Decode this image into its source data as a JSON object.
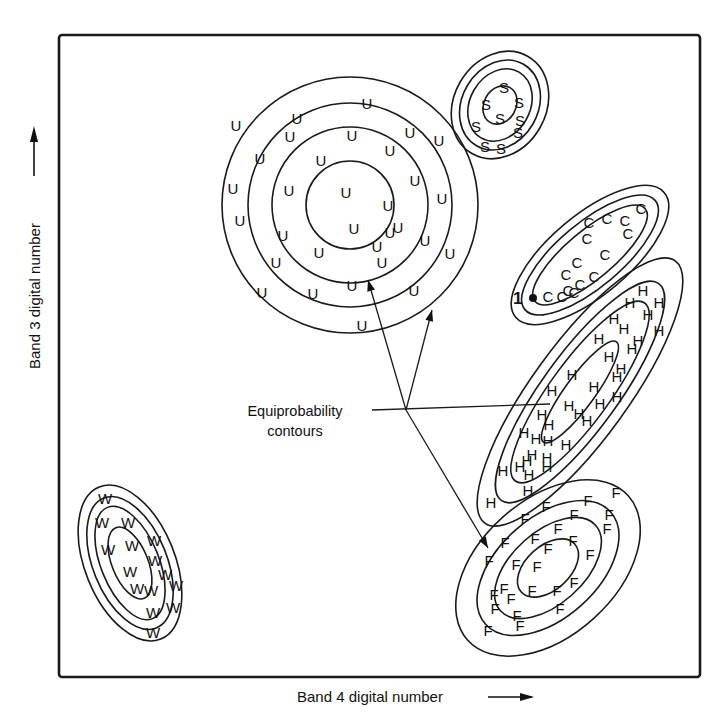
{
  "figure": {
    "x_axis_label": "Band 4 digital number",
    "y_axis_label": "Band 3 digital number",
    "annotation": {
      "line1": "Equiprobability",
      "line2": "contours",
      "anchor": [
        406,
        410
      ],
      "arrow_targets": [
        [
          368,
          280
        ],
        [
          432,
          310
        ],
        [
          488,
          548
        ]
      ],
      "line_target": [
        550,
        404
      ]
    },
    "unknown_pixel": {
      "label": "1",
      "position": [
        533,
        298
      ]
    },
    "frame": {
      "x": 59,
      "y": 35,
      "width": 641,
      "height": 642
    }
  },
  "clusters": [
    {
      "class": "U",
      "name": "Urban",
      "center": [
        350,
        205
      ],
      "rotation": 0,
      "contours": [
        [
          128,
          128
        ],
        [
          102,
          102
        ],
        [
          78,
          78
        ],
        [
          44,
          44
        ]
      ],
      "points": [
        [
          297,
          118
        ],
        [
          367,
          103
        ],
        [
          236,
          125
        ],
        [
          290,
          136
        ],
        [
          352,
          135
        ],
        [
          410,
          132
        ],
        [
          439,
          140
        ],
        [
          260,
          158
        ],
        [
          321,
          160
        ],
        [
          390,
          150
        ],
        [
          415,
          180
        ],
        [
          233,
          188
        ],
        [
          289,
          190
        ],
        [
          346,
          192
        ],
        [
          388,
          205
        ],
        [
          442,
          198
        ],
        [
          240,
          220
        ],
        [
          283,
          235
        ],
        [
          354,
          228
        ],
        [
          390,
          232
        ],
        [
          425,
          240
        ],
        [
          276,
          262
        ],
        [
          319,
          252
        ],
        [
          382,
          262
        ],
        [
          450,
          253
        ],
        [
          262,
          292
        ],
        [
          313,
          293
        ],
        [
          352,
          285
        ],
        [
          414,
          290
        ],
        [
          362,
          325
        ],
        [
          377,
          246
        ],
        [
          398,
          227
        ]
      ]
    },
    {
      "class": "S",
      "name": "Sand",
      "center": [
        500,
        105
      ],
      "rotation": -60,
      "contours": [
        [
          56,
          46
        ],
        [
          47,
          38
        ],
        [
          38,
          30
        ],
        [
          20,
          16
        ]
      ],
      "points": [
        [
          504,
          87
        ],
        [
          486,
          104
        ],
        [
          519,
          102
        ],
        [
          500,
          118
        ],
        [
          520,
          120
        ],
        [
          476,
          126
        ],
        [
          518,
          132
        ],
        [
          485,
          146
        ],
        [
          501,
          148
        ]
      ]
    },
    {
      "class": "C",
      "name": "Corn",
      "center": [
        590,
        255
      ],
      "rotation": -40,
      "contours": [
        [
          97,
          40
        ],
        [
          85,
          32
        ],
        [
          72,
          24
        ]
      ],
      "points": [
        [
          641,
          208
        ],
        [
          589,
          222
        ],
        [
          607,
          218
        ],
        [
          625,
          220
        ],
        [
          587,
          238
        ],
        [
          628,
          233
        ],
        [
          605,
          254
        ],
        [
          577,
          262
        ],
        [
          566,
          274
        ],
        [
          594,
          276
        ],
        [
          574,
          292
        ],
        [
          580,
          284
        ],
        [
          548,
          296
        ],
        [
          562,
          296
        ],
        [
          568,
          290
        ]
      ]
    },
    {
      "class": "H",
      "name": "Hay",
      "center": [
        580,
        392
      ],
      "rotation": -54,
      "contours": [
        [
          162,
          48
        ],
        [
          134,
          38
        ],
        [
          110,
          30
        ],
        [
          62,
          15
        ]
      ],
      "points": [
        [
          643,
          290
        ],
        [
          630,
          302
        ],
        [
          659,
          302
        ],
        [
          614,
          318
        ],
        [
          624,
          328
        ],
        [
          648,
          314
        ],
        [
          659,
          330
        ],
        [
          638,
          340
        ],
        [
          599,
          338
        ],
        [
          609,
          356
        ],
        [
          632,
          348
        ],
        [
          621,
          368
        ],
        [
          617,
          376
        ],
        [
          572,
          374
        ],
        [
          594,
          386
        ],
        [
          552,
          390
        ],
        [
          617,
          396
        ],
        [
          600,
          403
        ],
        [
          569,
          405
        ],
        [
          542,
          414
        ],
        [
          549,
          424
        ],
        [
          579,
          413
        ],
        [
          524,
          432
        ],
        [
          536,
          438
        ],
        [
          587,
          420
        ],
        [
          548,
          440
        ],
        [
          532,
          454
        ],
        [
          527,
          460
        ],
        [
          566,
          444
        ],
        [
          547,
          457
        ],
        [
          520,
          466
        ],
        [
          503,
          470
        ],
        [
          547,
          466
        ],
        [
          529,
          474
        ],
        [
          491,
          502
        ],
        [
          528,
          490
        ]
      ]
    },
    {
      "class": "F",
      "name": "Forest",
      "center": [
        548,
        568
      ],
      "rotation": -42,
      "contours": [
        [
          108,
          68
        ],
        [
          84,
          50
        ],
        [
          64,
          36
        ],
        [
          36,
          22
        ]
      ],
      "points": [
        [
          616,
          492
        ],
        [
          588,
          500
        ],
        [
          546,
          506
        ],
        [
          574,
          514
        ],
        [
          609,
          514
        ],
        [
          525,
          518
        ],
        [
          607,
          528
        ],
        [
          558,
          528
        ],
        [
          535,
          538
        ],
        [
          505,
          542
        ],
        [
          573,
          540
        ],
        [
          548,
          548
        ],
        [
          590,
          554
        ],
        [
          489,
          560
        ],
        [
          516,
          564
        ],
        [
          537,
          566
        ],
        [
          574,
          582
        ],
        [
          504,
          588
        ],
        [
          494,
          594
        ],
        [
          532,
          590
        ],
        [
          557,
          590
        ],
        [
          495,
          608
        ],
        [
          511,
          598
        ],
        [
          517,
          615
        ],
        [
          560,
          608
        ],
        [
          488,
          630
        ],
        [
          520,
          625
        ]
      ]
    },
    {
      "class": "W",
      "name": "Water",
      "center": [
        130,
        563
      ],
      "rotation": 68,
      "contours": [
        [
          82,
          45
        ],
        [
          70,
          37
        ],
        [
          60,
          29
        ],
        [
          38,
          18
        ]
      ],
      "points": [
        [
          105,
          498
        ],
        [
          102,
          522
        ],
        [
          128,
          522
        ],
        [
          154,
          540
        ],
        [
          108,
          549
        ],
        [
          132,
          545
        ],
        [
          155,
          560
        ],
        [
          130,
          571
        ],
        [
          165,
          574
        ],
        [
          137,
          588
        ],
        [
          151,
          590
        ],
        [
          176,
          585
        ],
        [
          153,
          612
        ],
        [
          173,
          607
        ],
        [
          153,
          632
        ]
      ]
    }
  ]
}
